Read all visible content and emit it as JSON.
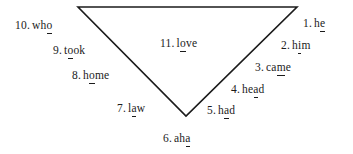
{
  "figure": {
    "kind": "inverted-triangle-word-diagram",
    "background_color": "#ffffff",
    "ink_color": "#1b1b1b",
    "shape": {
      "name": "downward-pointing-triangle",
      "stroke_color": "#1b1b1b",
      "stroke_width": 1.6,
      "fill": "none",
      "vertices": [
        {
          "label": "top-left",
          "x": 78,
          "y": 7
        },
        {
          "label": "top-right",
          "x": 297,
          "y": 7
        },
        {
          "label": "bottom-apex",
          "x": 186,
          "y": 116
        }
      ]
    },
    "items": [
      {
        "index": 1,
        "number": "1.",
        "word": "he",
        "underlined_letter": "e",
        "underline_position": 1,
        "x": 303,
        "y": 18,
        "align": "left"
      },
      {
        "index": 2,
        "number": "2.",
        "word": "him",
        "underlined_letter": "i",
        "underline_position": 1,
        "x": 281,
        "y": 40,
        "align": "left"
      },
      {
        "index": 3,
        "number": "3.",
        "word": "came",
        "underlined_letter": "m",
        "underline_position": 2,
        "x": 255,
        "y": 62,
        "align": "left"
      },
      {
        "index": 4,
        "number": "4.",
        "word": "head",
        "underlined_letter": "a",
        "underline_position": 2,
        "x": 231,
        "y": 84,
        "align": "left"
      },
      {
        "index": 5,
        "number": "5.",
        "word": "had",
        "underlined_letter": "a",
        "underline_position": 1,
        "x": 207,
        "y": 105,
        "align": "left"
      },
      {
        "index": 6,
        "number": "6.",
        "word": "aha",
        "underlined_letter": "a",
        "underline_position": 2,
        "x": 163,
        "y": 133,
        "align": "left"
      },
      {
        "index": 7,
        "number": "7.",
        "word": "law",
        "underlined_letter": "a",
        "underline_position": 1,
        "x": 117,
        "y": 103,
        "align": "left"
      },
      {
        "index": 8,
        "number": "8.",
        "word": "home",
        "underlined_letter": "o",
        "underline_position": 1,
        "x": 72,
        "y": 70,
        "align": "left"
      },
      {
        "index": 9,
        "number": "9.",
        "word": "took",
        "underlined_letter": "o",
        "underline_position": 1,
        "x": 53,
        "y": 45,
        "align": "left"
      },
      {
        "index": 10,
        "number": "10.",
        "word": "who",
        "underlined_letter": "o",
        "underline_position": 2,
        "x": 15,
        "y": 20,
        "align": "left"
      },
      {
        "index": 11,
        "number": "11.",
        "word": "love",
        "underlined_letter": "o",
        "underline_position": 1,
        "x": 160,
        "y": 38,
        "align": "left"
      }
    ]
  }
}
